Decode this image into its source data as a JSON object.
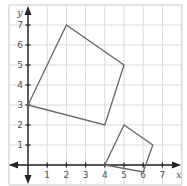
{
  "diagram": {
    "type": "coordinate-grid",
    "axes": {
      "x_label": "x",
      "y_label": "y",
      "x_ticks": [
        "1",
        "2",
        "3",
        "4",
        "5",
        "6",
        "7"
      ],
      "y_ticks": [
        "1",
        "2",
        "3",
        "4",
        "5",
        "6",
        "7"
      ]
    },
    "shapes": [
      {
        "name": "large-quadrilateral",
        "vertices": [
          [
            0,
            3
          ],
          [
            2,
            7
          ],
          [
            5,
            5
          ],
          [
            4,
            2
          ]
        ]
      },
      {
        "name": "small-quadrilateral",
        "vertices": [
          [
            4,
            0
          ],
          [
            5,
            2
          ],
          [
            6.5,
            1
          ],
          [
            6,
            -0.35
          ]
        ]
      }
    ],
    "colors": {
      "grid": "#d9d9d9",
      "axis": "#222222",
      "shape_stroke": "#666666"
    }
  }
}
